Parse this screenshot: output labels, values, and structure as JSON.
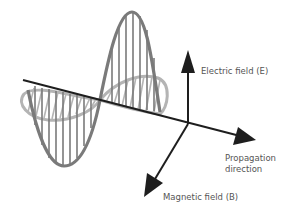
{
  "labels": {
    "electric_field": "Electric field (E)",
    "propagation_line1": "Propagation",
    "propagation_line2": "direction",
    "magnetic_field": "Magnetic field (B)"
  },
  "colors": {
    "axis": "#1e1e1e",
    "electric_wave": "#7a7a7a",
    "magnetic_wave": "#b4b4b4",
    "label_text": "#555555",
    "background": "#ffffff"
  },
  "waves": [
    {
      "name": "electric-wave",
      "orientation": "vertical",
      "hatch": "vertical-lines"
    },
    {
      "name": "magnetic-wave",
      "orientation": "horizontal",
      "hatch": "diagonal-lines"
    }
  ],
  "axes": [
    {
      "name": "electric-field-axis",
      "direction": "up"
    },
    {
      "name": "propagation-axis",
      "direction": "right-down"
    },
    {
      "name": "magnetic-field-axis",
      "direction": "down-left"
    }
  ]
}
